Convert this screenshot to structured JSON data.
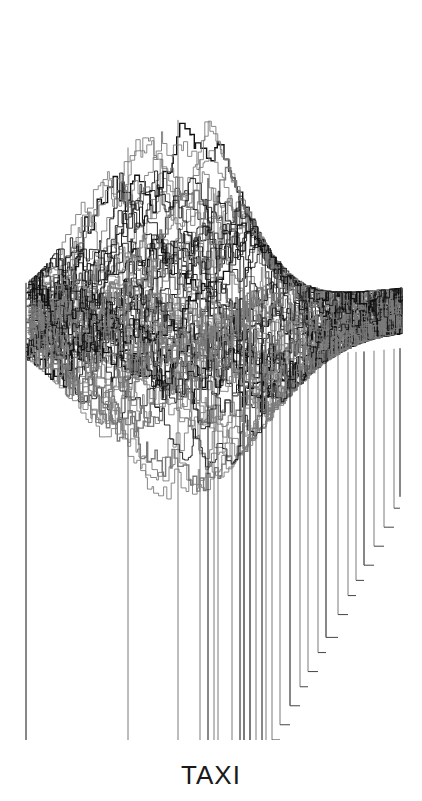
{
  "artwork": {
    "caption": "TAXI",
    "style": "dense overlapping step-line (cityscape-like) plot",
    "colors": {
      "background": "#ffffff",
      "line_dark": "#111111",
      "line_gray": "#7a7a7a",
      "caption": "#1a1a1a"
    },
    "frame": {
      "left": 26,
      "right": 402,
      "base_left": 743,
      "top_peak": 42
    }
  }
}
